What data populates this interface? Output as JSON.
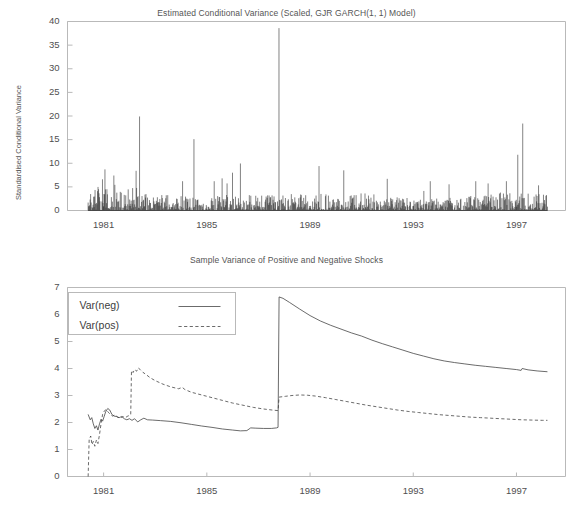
{
  "page": {
    "background": "#ffffff",
    "line_color": "#3a3a3a",
    "axis_color": "#b9b9b9",
    "text_color": "#4f4f4f"
  },
  "chart_data": [
    {
      "id": "conditional-variance",
      "type": "line",
      "title": "Estimated Conditional Variance (Scaled, GJR GARCH(1, 1) Model)",
      "xlabel": "",
      "ylabel": "Standardised Conditional Variance",
      "ylim": [
        0,
        40
      ],
      "yticks": [
        0,
        5,
        10,
        15,
        20,
        25,
        30,
        35,
        40
      ],
      "ytick_labels": [
        "0",
        "5",
        "10",
        "15",
        "20",
        "25",
        "30",
        "35",
        "40"
      ],
      "xlim": [
        1979.6,
        1998.9
      ],
      "xticks": [
        1981,
        1985,
        1989,
        1993,
        1997
      ],
      "xtick_labels": [
        "1981",
        "1985",
        "1989",
        "1993",
        "1997"
      ],
      "grid": false,
      "legend": "none",
      "series": [
        {
          "name": "Standardised Conditional Variance",
          "style": "solid",
          "x_start": 1980.4,
          "x_end": 1998.2,
          "n_points": 930,
          "baseline": 0,
          "notable_peaks": [
            {
              "x": 1987.8,
              "y": 38.6
            },
            {
              "x": 1982.4,
              "y": 19.9
            },
            {
              "x": 1997.25,
              "y": 18.4
            },
            {
              "x": 1984.5,
              "y": 15.1
            },
            {
              "x": 1986.3,
              "y": 9.95
            },
            {
              "x": 1989.35,
              "y": 9.4
            },
            {
              "x": 1981.05,
              "y": 8.7
            },
            {
              "x": 1990.3,
              "y": 8.5
            },
            {
              "x": 1982.25,
              "y": 8.4
            },
            {
              "x": 1986.0,
              "y": 8.0
            },
            {
              "x": 1981.4,
              "y": 7.4
            },
            {
              "x": 1997.05,
              "y": 11.8
            },
            {
              "x": 1992.0,
              "y": 6.7
            },
            {
              "x": 1985.6,
              "y": 6.8
            },
            {
              "x": 1980.95,
              "y": 6.6
            }
          ],
          "typical_range": [
            0.05,
            3.0
          ]
        }
      ]
    },
    {
      "id": "sample-variance-shocks",
      "type": "line",
      "title": "Sample Variance of Positive and Negative Shocks",
      "xlabel": "",
      "ylabel": "",
      "ylim": [
        0,
        7
      ],
      "yticks": [
        0,
        1,
        2,
        3,
        4,
        5,
        6,
        7
      ],
      "ytick_labels": [
        "0",
        "1",
        "2",
        "3",
        "4",
        "5",
        "6",
        "7"
      ],
      "xlim": [
        1979.6,
        1998.9
      ],
      "xticks": [
        1981,
        1985,
        1989,
        1993,
        1997
      ],
      "xtick_labels": [
        "1981",
        "1985",
        "1989",
        "1993",
        "1997"
      ],
      "grid": false,
      "legend_position": "top-left",
      "legend_entries": [
        {
          "label": "Var(neg)",
          "style": "solid"
        },
        {
          "label": "Var(pos)",
          "style": "dashed"
        }
      ],
      "series": [
        {
          "name": "Var(neg)",
          "style": "solid",
          "points": [
            [
              1980.4,
              2.3
            ],
            [
              1980.48,
              2.1
            ],
            [
              1980.54,
              2.18
            ],
            [
              1980.6,
              1.95
            ],
            [
              1980.66,
              1.78
            ],
            [
              1980.72,
              1.88
            ],
            [
              1980.78,
              1.72
            ],
            [
              1980.84,
              1.95
            ],
            [
              1980.9,
              2.12
            ],
            [
              1980.96,
              2.05
            ],
            [
              1981.02,
              2.22
            ],
            [
              1981.08,
              2.4
            ],
            [
              1981.16,
              2.52
            ],
            [
              1981.24,
              2.46
            ],
            [
              1981.32,
              2.3
            ],
            [
              1981.4,
              2.24
            ],
            [
              1981.5,
              2.22
            ],
            [
              1981.6,
              2.18
            ],
            [
              1981.7,
              2.22
            ],
            [
              1981.8,
              2.14
            ],
            [
              1981.9,
              2.1
            ],
            [
              1982.0,
              2.14
            ],
            [
              1982.1,
              2.08
            ],
            [
              1982.2,
              2.14
            ],
            [
              1982.32,
              2.02
            ],
            [
              1982.44,
              2.1
            ],
            [
              1982.56,
              2.16
            ],
            [
              1982.7,
              2.1
            ],
            [
              1982.9,
              2.09
            ],
            [
              1983.2,
              2.07
            ],
            [
              1983.6,
              2.04
            ],
            [
              1984.0,
              1.99
            ],
            [
              1984.4,
              1.93
            ],
            [
              1984.8,
              1.87
            ],
            [
              1985.2,
              1.82
            ],
            [
              1985.6,
              1.76
            ],
            [
              1986.0,
              1.72
            ],
            [
              1986.3,
              1.69
            ],
            [
              1986.55,
              1.7
            ],
            [
              1986.7,
              1.8
            ],
            [
              1986.9,
              1.79
            ],
            [
              1987.2,
              1.78
            ],
            [
              1987.5,
              1.78
            ],
            [
              1987.7,
              1.8
            ],
            [
              1987.76,
              1.82
            ],
            [
              1987.8,
              6.65
            ],
            [
              1987.95,
              6.6
            ],
            [
              1988.2,
              6.45
            ],
            [
              1988.6,
              6.2
            ],
            [
              1989.0,
              5.96
            ],
            [
              1989.4,
              5.76
            ],
            [
              1989.8,
              5.6
            ],
            [
              1990.2,
              5.46
            ],
            [
              1990.6,
              5.32
            ],
            [
              1991.0,
              5.2
            ],
            [
              1991.4,
              5.05
            ],
            [
              1991.8,
              4.92
            ],
            [
              1992.2,
              4.8
            ],
            [
              1992.6,
              4.68
            ],
            [
              1993.0,
              4.56
            ],
            [
              1993.4,
              4.46
            ],
            [
              1993.8,
              4.36
            ],
            [
              1994.2,
              4.28
            ],
            [
              1994.6,
              4.22
            ],
            [
              1995.0,
              4.17
            ],
            [
              1995.4,
              4.12
            ],
            [
              1995.8,
              4.08
            ],
            [
              1996.2,
              4.04
            ],
            [
              1996.6,
              4.0
            ],
            [
              1997.0,
              3.96
            ],
            [
              1997.18,
              3.93
            ],
            [
              1997.22,
              4.0
            ],
            [
              1997.45,
              3.95
            ],
            [
              1997.8,
              3.91
            ],
            [
              1998.2,
              3.88
            ]
          ]
        },
        {
          "name": "Var(pos)",
          "style": "dashed",
          "points": [
            [
              1980.4,
              0.0
            ],
            [
              1980.44,
              1.38
            ],
            [
              1980.5,
              1.5
            ],
            [
              1980.55,
              1.18
            ],
            [
              1980.6,
              1.3
            ],
            [
              1980.66,
              1.12
            ],
            [
              1980.72,
              1.35
            ],
            [
              1980.78,
              1.22
            ],
            [
              1980.84,
              1.55
            ],
            [
              1980.9,
              1.95
            ],
            [
              1980.96,
              2.3
            ],
            [
              1981.02,
              2.42
            ],
            [
              1981.1,
              2.48
            ],
            [
              1981.18,
              2.38
            ],
            [
              1981.26,
              2.3
            ],
            [
              1981.34,
              2.24
            ],
            [
              1981.44,
              2.28
            ],
            [
              1981.54,
              2.2
            ],
            [
              1981.64,
              2.16
            ],
            [
              1981.74,
              2.22
            ],
            [
              1981.84,
              2.18
            ],
            [
              1981.94,
              2.24
            ],
            [
              1982.0,
              2.26
            ],
            [
              1982.05,
              2.3
            ],
            [
              1982.08,
              3.92
            ],
            [
              1982.14,
              3.85
            ],
            [
              1982.2,
              3.96
            ],
            [
              1982.28,
              3.9
            ],
            [
              1982.34,
              4.02
            ],
            [
              1982.42,
              3.96
            ],
            [
              1982.52,
              3.86
            ],
            [
              1982.64,
              3.78
            ],
            [
              1982.8,
              3.66
            ],
            [
              1983.0,
              3.55
            ],
            [
              1983.3,
              3.42
            ],
            [
              1983.6,
              3.32
            ],
            [
              1983.9,
              3.25
            ],
            [
              1984.05,
              3.3
            ],
            [
              1984.15,
              3.22
            ],
            [
              1984.4,
              3.12
            ],
            [
              1984.8,
              3.02
            ],
            [
              1985.2,
              2.92
            ],
            [
              1985.6,
              2.82
            ],
            [
              1986.0,
              2.72
            ],
            [
              1986.4,
              2.64
            ],
            [
              1986.8,
              2.56
            ],
            [
              1987.2,
              2.5
            ],
            [
              1987.55,
              2.46
            ],
            [
              1987.76,
              2.44
            ],
            [
              1987.8,
              2.94
            ],
            [
              1988.05,
              2.97
            ],
            [
              1988.3,
              3.0
            ],
            [
              1988.6,
              3.02
            ],
            [
              1988.9,
              3.01
            ],
            [
              1989.2,
              2.98
            ],
            [
              1989.6,
              2.92
            ],
            [
              1990.0,
              2.85
            ],
            [
              1990.4,
              2.78
            ],
            [
              1990.8,
              2.71
            ],
            [
              1991.2,
              2.64
            ],
            [
              1991.6,
              2.58
            ],
            [
              1992.0,
              2.52
            ],
            [
              1992.4,
              2.46
            ],
            [
              1992.8,
              2.41
            ],
            [
              1993.2,
              2.37
            ],
            [
              1993.6,
              2.33
            ],
            [
              1994.0,
              2.29
            ],
            [
              1994.4,
              2.26
            ],
            [
              1994.8,
              2.23
            ],
            [
              1995.2,
              2.2
            ],
            [
              1995.6,
              2.18
            ],
            [
              1996.0,
              2.16
            ],
            [
              1996.4,
              2.14
            ],
            [
              1996.8,
              2.12
            ],
            [
              1997.2,
              2.1
            ],
            [
              1997.6,
              2.09
            ],
            [
              1998.0,
              2.08
            ],
            [
              1998.2,
              2.08
            ]
          ]
        }
      ]
    }
  ]
}
